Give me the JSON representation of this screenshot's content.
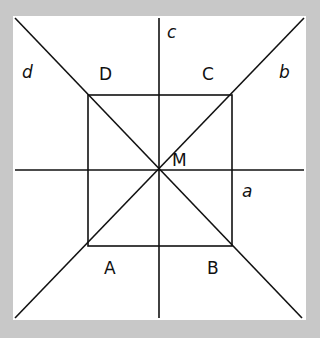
{
  "figure": {
    "background": "#c8c8c8",
    "panel": "#ffffff",
    "line_color": "#111111",
    "square_vertices": {
      "A": "A",
      "B": "B",
      "C": "C",
      "D": "D"
    },
    "center": "M",
    "lines": {
      "a": "a",
      "b": "b",
      "c": "c",
      "d": "d"
    }
  }
}
